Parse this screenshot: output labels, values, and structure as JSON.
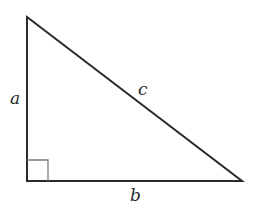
{
  "diagram": {
    "type": "right-triangle",
    "stroke_color": "#2a2a2a",
    "right_angle_marker_color": "#7a7a7a",
    "vertices": {
      "top": [
        27,
        17
      ],
      "right_angle": [
        27,
        181
      ],
      "bottom_right": [
        242,
        181
      ]
    },
    "labels": {
      "a": "a",
      "b": "b",
      "c": "c"
    }
  }
}
